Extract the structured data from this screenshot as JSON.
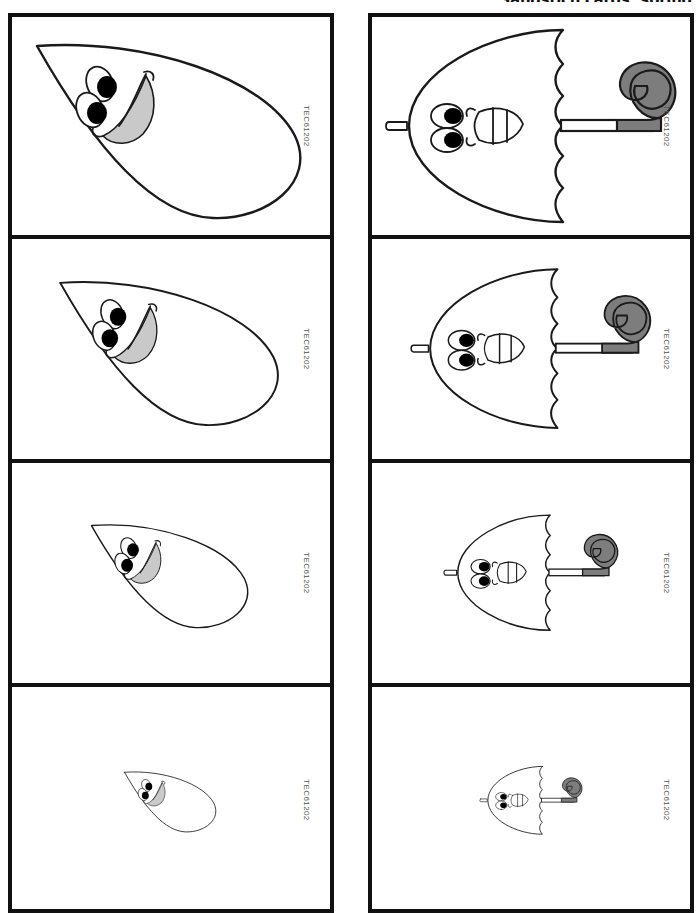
{
  "page": {
    "title": "Sandstich cards: spring",
    "title_clipped": true,
    "background_color": "#ffffff",
    "ink_color": "#1a1a1a",
    "width": 700,
    "height": 896
  },
  "columns": [
    {
      "name": "raindrop-column",
      "subject": "raindrop",
      "cards": [
        {
          "code": "TEC61202",
          "size_label": "largest",
          "scale": 1.0
        },
        {
          "code": "TEC61202",
          "size_label": "large",
          "scale": 0.8
        },
        {
          "code": "TEC61202",
          "size_label": "medium",
          "scale": 0.58
        },
        {
          "code": "TEC61202",
          "size_label": "smallest",
          "scale": 0.34
        }
      ]
    },
    {
      "name": "umbrella-column",
      "subject": "umbrella",
      "cards": [
        {
          "code": "TEC61202",
          "size_label": "largest",
          "scale": 1.0
        },
        {
          "code": "TEC61202",
          "size_label": "large",
          "scale": 0.8
        },
        {
          "code": "TEC61202",
          "size_label": "medium",
          "scale": 0.58
        },
        {
          "code": "TEC61202",
          "size_label": "smallest",
          "scale": 0.34
        }
      ]
    }
  ],
  "artwork": {
    "raindrop": {
      "name": "smiling-raindrop",
      "description": "teardrop outline tilted with point to upper-left, two oval eyes with black pupils and an open smiling mouth with grey fill",
      "outline_color": "#1a1a1a",
      "mouth_fill": "#c9c9c9",
      "pupil_color": "#000000"
    },
    "umbrella": {
      "name": "smiling-umbrella",
      "description": "umbrella rotated 90 degrees, dome canopy opening to the left with six scallops along the right edge, white shaft and grey hooked handle to the right, face with two eyes and a toothed mouth on the canopy",
      "outline_color": "#1a1a1a",
      "handle_fill": "#7d7d7d",
      "scallop_count": 6,
      "pupil_color": "#000000"
    }
  }
}
